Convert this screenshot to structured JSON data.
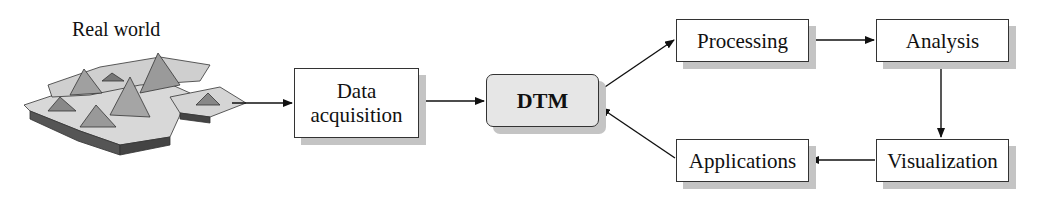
{
  "diagram": {
    "real_world_label": "Real world",
    "nodes": {
      "data_acquisition": {
        "line1": "Data",
        "line2": "acquisition"
      },
      "dtm": "DTM",
      "processing": "Processing",
      "analysis": "Analysis",
      "visualization": "Visualization",
      "applications": "Applications"
    },
    "edges": [
      [
        "Real world",
        "Data acquisition"
      ],
      [
        "Data acquisition",
        "DTM"
      ],
      [
        "DTM",
        "Processing"
      ],
      [
        "Processing",
        "Analysis"
      ],
      [
        "Analysis",
        "Visualization"
      ],
      [
        "Visualization",
        "Applications"
      ],
      [
        "Applications",
        "DTM"
      ]
    ],
    "colors": {
      "dtm_fill": "#e6e6e6",
      "shadow": "#c4c4c4",
      "line": "#111111"
    }
  }
}
